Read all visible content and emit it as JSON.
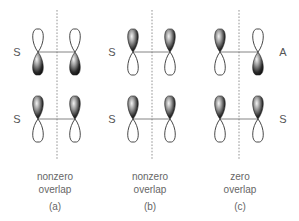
{
  "panels": [
    {
      "id": "a",
      "label": "(a)",
      "caption_line1": "nonzero",
      "caption_line2": "overlap",
      "mirror_x": 57,
      "orbital_x": [
        38,
        75
      ],
      "rows": [
        {
          "y": 52,
          "symmetry_label": "S",
          "label_side": "left",
          "shaded": [
            "bottom",
            "bottom"
          ]
        },
        {
          "y": 119,
          "symmetry_label": "S",
          "label_side": "left",
          "shaded": [
            "top",
            "top"
          ]
        }
      ]
    },
    {
      "id": "b",
      "label": "(b)",
      "caption_line1": "nonzero",
      "caption_line2": "overlap",
      "mirror_x": 152,
      "orbital_x": [
        133,
        170
      ],
      "rows": [
        {
          "y": 52,
          "symmetry_label": "S",
          "label_side": "left",
          "shaded": [
            "top",
            "top"
          ]
        },
        {
          "y": 119,
          "symmetry_label": "S",
          "label_side": "left",
          "shaded": [
            "top",
            "top"
          ]
        }
      ]
    },
    {
      "id": "c",
      "label": "(c)",
      "caption_line1": "zero",
      "caption_line2": "overlap",
      "mirror_x": 239,
      "orbital_x": [
        220,
        258
      ],
      "rows": [
        {
          "y": 52,
          "symmetry_label": "A",
          "label_side": "right",
          "shaded": [
            "top",
            "bottom"
          ]
        },
        {
          "y": 119,
          "symmetry_label": "S",
          "label_side": "right",
          "shaded": [
            "top",
            "top"
          ]
        }
      ]
    }
  ],
  "colors": {
    "lobe_dark": "#111111",
    "lobe_highlight": "#f2f2f2",
    "outline": "#333333",
    "mirror_line": "#888888",
    "text": "#555555"
  }
}
